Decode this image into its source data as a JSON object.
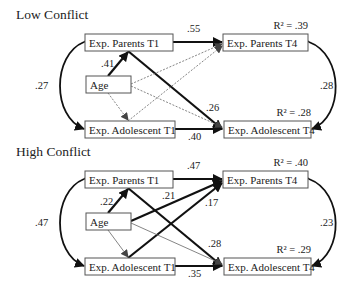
{
  "panels": [
    {
      "id": "low",
      "title": "Low Conflict",
      "nodes": {
        "parents_t1": "Exp. Parents T1",
        "age": "Age",
        "adolescent_t1": "Exp. Adolescent T1",
        "parents_t4": "Exp. Parents T4",
        "adolescent_t4": "Exp. Adolescent T4"
      },
      "r2": {
        "parents_t4": "R² = .39",
        "adolescent_t4": "R² = .28"
      },
      "correlations": {
        "t1": ".27",
        "t4": ".28"
      },
      "paths": [
        {
          "from": "parents_t1",
          "to": "parents_t4",
          "coef": ".55",
          "style": "thick"
        },
        {
          "from": "parents_t1",
          "to": "adolescent_t4",
          "coef": ".26",
          "style": "thick"
        },
        {
          "from": "adolescent_t1",
          "to": "adolescent_t4",
          "coef": ".40",
          "style": "thick"
        },
        {
          "from": "age",
          "to": "parents_t1",
          "coef": ".41",
          "style": "thick"
        },
        {
          "from": "age",
          "to": "parents_t4",
          "coef": "",
          "style": "dashed"
        },
        {
          "from": "age",
          "to": "adolescent_t4",
          "coef": "",
          "style": "dashed"
        },
        {
          "from": "age",
          "to": "adolescent_t1",
          "coef": "",
          "style": "dashed"
        },
        {
          "from": "adolescent_t1",
          "to": "parents_t4",
          "coef": "",
          "style": "dashed"
        }
      ]
    },
    {
      "id": "high",
      "title": "High Conflict",
      "nodes": {
        "parents_t1": "Exp. Parents T1",
        "age": "Age",
        "adolescent_t1": "Exp. Adolescent T1",
        "parents_t4": "Exp. Parents T4",
        "adolescent_t4": "Exp. Adolescent T4"
      },
      "r2": {
        "parents_t4": "R² = .40",
        "adolescent_t4": "R² = .29"
      },
      "correlations": {
        "t1": ".47",
        "t4": ".23"
      },
      "paths": [
        {
          "from": "parents_t1",
          "to": "parents_t4",
          "coef": ".47",
          "style": "thick"
        },
        {
          "from": "parents_t1",
          "to": "adolescent_t4",
          "coef": ".28",
          "style": "thick"
        },
        {
          "from": "adolescent_t1",
          "to": "adolescent_t4",
          "coef": ".35",
          "style": "thick"
        },
        {
          "from": "age",
          "to": "parents_t1",
          "coef": ".22",
          "style": "thick"
        },
        {
          "from": "age",
          "to": "parents_t4",
          "coef": ".21",
          "style": "thick"
        },
        {
          "from": "adolescent_t1",
          "to": "parents_t4",
          "coef": ".17",
          "style": "thick"
        },
        {
          "from": "age",
          "to": "adolescent_t1",
          "coef": "",
          "style": "thin"
        },
        {
          "from": "age",
          "to": "adolescent_t4",
          "coef": "",
          "style": "thin"
        }
      ]
    }
  ]
}
